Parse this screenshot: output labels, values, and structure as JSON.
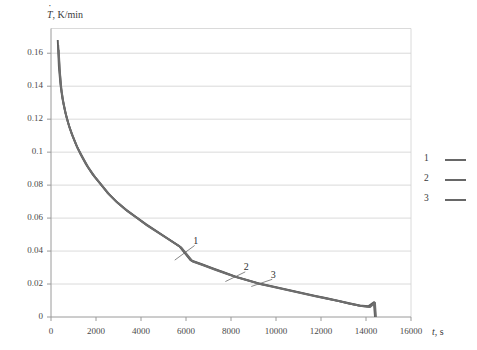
{
  "chart_data": {
    "type": "line",
    "title": "",
    "xlabel": "t, s",
    "ylabel": "Ṫ, K/min",
    "xlim": [
      0,
      16000
    ],
    "ylim": [
      0,
      0.175
    ],
    "xticks": [
      "0",
      "2000",
      "4000",
      "6000",
      "8000",
      "10000",
      "12000",
      "14000",
      "16000"
    ],
    "xtick_values": [
      0,
      2000,
      4000,
      6000,
      8000,
      10000,
      12000,
      14000,
      16000
    ],
    "yticks": [
      "0",
      "0.02",
      "0.04",
      "0.06",
      "0.08",
      "0.1",
      "0.12",
      "0.14",
      "0.16"
    ],
    "ytick_values": [
      0,
      0.02,
      0.04,
      0.06,
      0.08,
      0.1,
      0.12,
      0.14,
      0.16
    ],
    "grid": "horizontal",
    "legend_position": "right",
    "line_color": "#5c5c5c",
    "grid_color": "#d0d0d0",
    "axis_color": "#9a9a9a",
    "series": [
      {
        "name": "1",
        "color": "#5c5c5c",
        "x": [
          300,
          350,
          420,
          500,
          620,
          760,
          920,
          1100,
          1320,
          1560,
          1850,
          2150,
          2500,
          2900,
          3300,
          3750,
          4200,
          4700,
          5200,
          5700,
          6200,
          6700,
          7200,
          7700,
          8200,
          8700,
          9200,
          9700,
          10200,
          10700,
          11200,
          11700,
          12200,
          12700,
          13200,
          13700,
          14100,
          14350,
          14400
        ],
        "values": [
          0.168,
          0.152,
          0.141,
          0.133,
          0.125,
          0.118,
          0.111,
          0.105,
          0.0985,
          0.0925,
          0.0865,
          0.0815,
          0.0755,
          0.07,
          0.0655,
          0.061,
          0.0565,
          0.052,
          0.0475,
          0.043,
          0.0345,
          0.032,
          0.0295,
          0.027,
          0.0245,
          0.0225,
          0.0205,
          0.019,
          0.0175,
          0.016,
          0.0145,
          0.013,
          0.0115,
          0.01,
          0.0085,
          0.007,
          0.0065,
          0.009,
          0.0
        ]
      },
      {
        "name": "2",
        "color": "#646464",
        "x": [
          320,
          380,
          450,
          540,
          660,
          800,
          960,
          1150,
          1380,
          1620,
          1900,
          2200,
          2550,
          2950,
          3350,
          3800,
          4250,
          4750,
          5250,
          5750,
          6250,
          6750,
          7250,
          7750,
          8250,
          8750,
          9250,
          9750,
          10250,
          10750,
          11250,
          11750,
          12250,
          12750,
          13250,
          13750,
          14150,
          14380,
          14420
        ],
        "values": [
          0.165,
          0.15,
          0.139,
          0.131,
          0.123,
          0.116,
          0.11,
          0.1035,
          0.0975,
          0.0915,
          0.0858,
          0.0808,
          0.0748,
          0.0694,
          0.0648,
          0.0604,
          0.0558,
          0.0514,
          0.047,
          0.0425,
          0.034,
          0.0316,
          0.029,
          0.0266,
          0.0242,
          0.0222,
          0.0202,
          0.0187,
          0.0172,
          0.0157,
          0.0142,
          0.0127,
          0.0112,
          0.0098,
          0.0082,
          0.0068,
          0.0062,
          0.0088,
          0.0
        ]
      },
      {
        "name": "3",
        "color": "#6e6e6e",
        "x": [
          340,
          400,
          470,
          560,
          690,
          830,
          1000,
          1190,
          1420,
          1670,
          1950,
          2250,
          2600,
          3000,
          3400,
          3850,
          4300,
          4800,
          5300,
          5800,
          6300,
          6800,
          7300,
          7800,
          8300,
          8800,
          9300,
          9800,
          10300,
          10800,
          11300,
          11800,
          12300,
          12800,
          13300,
          13800,
          14180,
          14400,
          14440
        ],
        "values": [
          0.162,
          0.148,
          0.137,
          0.129,
          0.121,
          0.1145,
          0.1085,
          0.1022,
          0.0963,
          0.0905,
          0.085,
          0.08,
          0.0742,
          0.0688,
          0.0642,
          0.0598,
          0.0552,
          0.0508,
          0.0464,
          0.042,
          0.0336,
          0.0312,
          0.0286,
          0.0262,
          0.0239,
          0.0219,
          0.0199,
          0.0184,
          0.0169,
          0.0154,
          0.0139,
          0.0124,
          0.011,
          0.0096,
          0.008,
          0.0066,
          0.006,
          0.0086,
          0.0
        ]
      }
    ],
    "annotations": [
      {
        "text": "1",
        "label_x": 6450,
        "label_y": 0.0455,
        "point_x": 5500,
        "point_y": 0.0345
      },
      {
        "text": "2",
        "label_x": 8700,
        "label_y": 0.0295,
        "point_x": 7750,
        "point_y": 0.0215
      },
      {
        "text": "3",
        "label_x": 9900,
        "label_y": 0.025,
        "point_x": 8900,
        "point_y": 0.0185
      }
    ],
    "legend": [
      {
        "label": "1",
        "color": "#676767"
      },
      {
        "label": "2",
        "color": "#676767"
      },
      {
        "label": "3",
        "color": "#676767"
      }
    ]
  }
}
